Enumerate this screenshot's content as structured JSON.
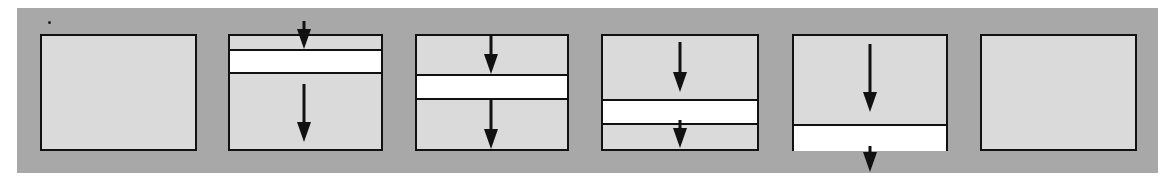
{
  "diagram": {
    "colors": {
      "page_background": "#ffffff",
      "backdrop": "#a8a8a8",
      "panel_fill": "#dadada",
      "band_fill": "#ffffff",
      "stroke": "#111111"
    },
    "backdrop": {
      "x": 17,
      "y": 8,
      "width": 1141,
      "height": 165
    },
    "speck": {
      "x": 48,
      "y": 21
    },
    "panels": [
      {
        "id": 1,
        "x": 40,
        "y": 34,
        "width": 157,
        "height": 117,
        "band": null,
        "arrows": []
      },
      {
        "id": 2,
        "x": 228,
        "y": 34,
        "width": 155,
        "height": 117,
        "band": {
          "top": 15,
          "height": 25,
          "flush_bottom": false
        },
        "arrows": [
          {
            "x": 76,
            "y1": -13,
            "y2": 15
          },
          {
            "x": 76,
            "y1": 50,
            "y2": 108
          }
        ]
      },
      {
        "id": 3,
        "x": 415,
        "y": 34,
        "width": 154,
        "height": 117,
        "band": {
          "top": 40,
          "height": 26,
          "flush_bottom": false
        },
        "arrows": [
          {
            "x": 76,
            "y1": 0,
            "y2": 40
          },
          {
            "x": 76,
            "y1": 66,
            "y2": 115
          }
        ]
      },
      {
        "id": 4,
        "x": 601,
        "y": 34,
        "width": 158,
        "height": 117,
        "band": {
          "top": 65,
          "height": 26,
          "flush_bottom": false
        },
        "arrows": [
          {
            "x": 79,
            "y1": 8,
            "y2": 58
          },
          {
            "x": 79,
            "y1": 86,
            "y2": 114
          }
        ]
      },
      {
        "id": 5,
        "x": 792,
        "y": 34,
        "width": 156,
        "height": 117,
        "band": {
          "top": 90,
          "height": 27,
          "flush_bottom": true
        },
        "arrows": [
          {
            "x": 78,
            "y1": 10,
            "y2": 78
          },
          {
            "x": 78,
            "y1": 112,
            "y2": 138
          }
        ]
      },
      {
        "id": 6,
        "x": 980,
        "y": 34,
        "width": 157,
        "height": 117,
        "band": null,
        "arrows": []
      }
    ]
  }
}
